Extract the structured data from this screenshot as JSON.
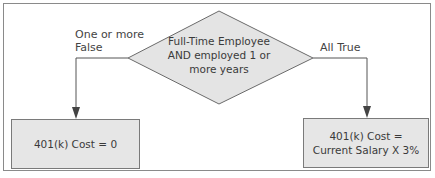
{
  "decision": {
    "text_line1": "Full-Time Employee",
    "text_line2": "AND employed 1 or",
    "text_line3": "more years"
  },
  "branches": {
    "false_label_line1": "One or more",
    "false_label_line2": "False",
    "true_label": "All True"
  },
  "outcomes": {
    "false_box": "401(k) Cost = 0",
    "true_box_line1": "401(k) Cost =",
    "true_box_line2": "Current Salary X 3%"
  },
  "colors": {
    "shape_fill": "#e6e6e6",
    "stroke": "#555555",
    "frame": "#8a8a8a"
  }
}
